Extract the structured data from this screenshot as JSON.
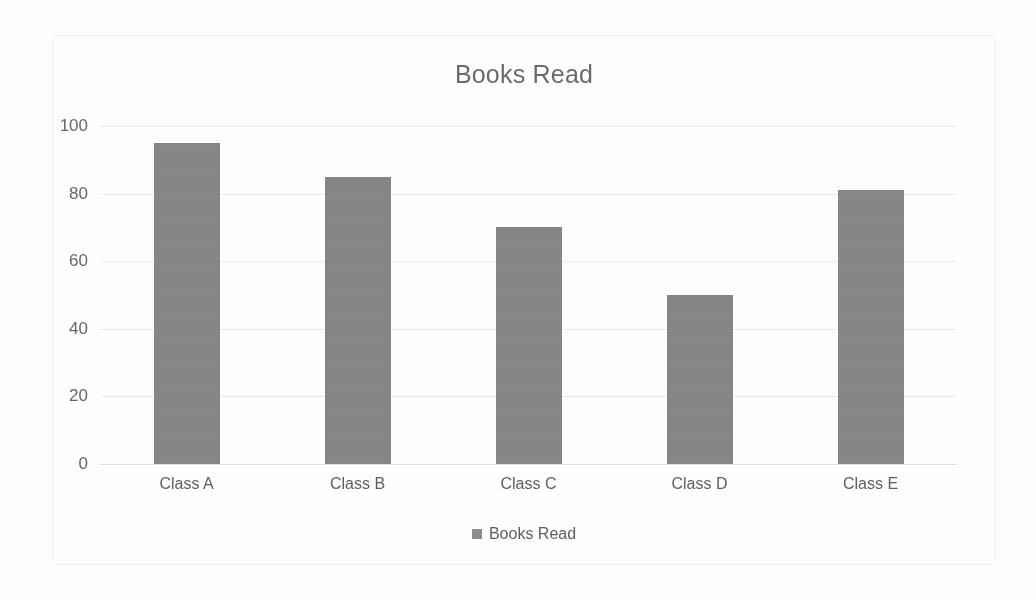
{
  "chart_data": {
    "type": "bar",
    "title": "Books Read",
    "categories": [
      "Class A",
      "Class B",
      "Class C",
      "Class D",
      "Class E"
    ],
    "values": [
      95,
      85,
      70,
      50,
      81
    ],
    "series": [
      {
        "name": "Books Read",
        "values": [
          95,
          85,
          70,
          50,
          81
        ]
      }
    ],
    "xlabel": "",
    "ylabel": "",
    "ylim": [
      0,
      100
    ],
    "yticks": [
      "0",
      "20",
      "40",
      "60",
      "80",
      "100"
    ],
    "ytick_values": [
      0,
      20,
      40,
      60,
      80,
      100
    ],
    "grid": true,
    "legend_position": "bottom",
    "legend_entries": [
      "Books Read"
    ],
    "bar_color": "#878787",
    "gridline_color": "#ebebeb",
    "text_color": "#5e5e5e",
    "title_color": "#6b6b6b"
  },
  "legend": {
    "label": "Books Read",
    "marker_name": "legend-color-swatch"
  }
}
